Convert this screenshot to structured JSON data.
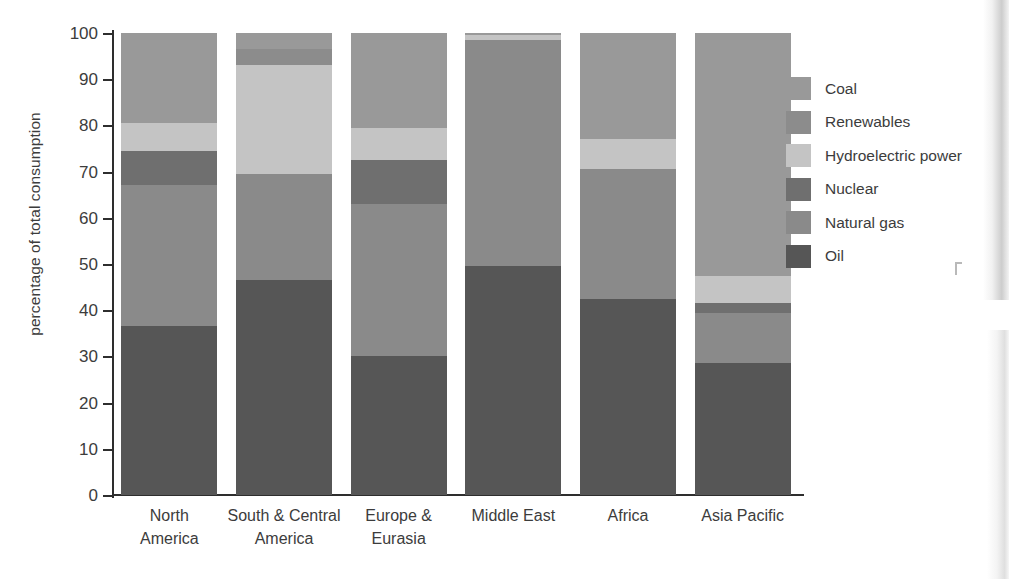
{
  "chart_data": {
    "type": "bar",
    "subtype": "stacked-bar-100",
    "title": "",
    "xlabel": "",
    "ylabel": "percentage of total consumption",
    "ylim": [
      0,
      100
    ],
    "yticks": [
      0,
      10,
      20,
      30,
      40,
      50,
      60,
      70,
      80,
      90,
      100
    ],
    "grid": false,
    "legend_position": "right",
    "categories": [
      "North America",
      "South & Central America",
      "Europe & Eurasia",
      "Middle East",
      "Africa",
      "Asia Pacific"
    ],
    "category_lines": [
      [
        "North",
        "America"
      ],
      [
        "South  &  Central",
        "America"
      ],
      [
        "Europe &",
        "Eurasia"
      ],
      [
        "Middle East",
        ""
      ],
      [
        "Africa",
        ""
      ],
      [
        "Asia Pacific",
        ""
      ]
    ],
    "series": [
      {
        "name": "Oil",
        "color": "#565656",
        "values": [
          36.5,
          46.5,
          30.0,
          49.5,
          42.5,
          28.5
        ]
      },
      {
        "name": "Natural gas",
        "color": "#8a8a8a",
        "values": [
          30.5,
          23.0,
          33.0,
          49.0,
          28.0,
          11.0
        ]
      },
      {
        "name": "Nuclear",
        "color": "#6f6f6f",
        "values": [
          7.5,
          0.0,
          9.5,
          0.0,
          0.0,
          2.0
        ]
      },
      {
        "name": "Hydroelectric power",
        "color": "#c4c4c4",
        "values": [
          6.0,
          23.5,
          7.0,
          1.0,
          6.5,
          6.0
        ]
      },
      {
        "name": "Renewables",
        "color": "#8c8c8c",
        "values": [
          0.0,
          3.5,
          0.0,
          0.0,
          0.0,
          0.0
        ]
      },
      {
        "name": "Coal",
        "color": "#999999",
        "values": [
          19.5,
          3.5,
          20.5,
          0.5,
          23.0,
          52.5
        ]
      }
    ]
  },
  "legend": {
    "items": [
      {
        "label": "Coal",
        "color": "#999999"
      },
      {
        "label": "Renewables",
        "color": "#8c8c8c"
      },
      {
        "label": "Hydroelectric power",
        "color": "#c4c4c4"
      },
      {
        "label": "Nuclear",
        "color": "#6f6f6f"
      },
      {
        "label": "Natural gas",
        "color": "#8a8a8a"
      },
      {
        "label": "Oil",
        "color": "#565656"
      }
    ]
  }
}
